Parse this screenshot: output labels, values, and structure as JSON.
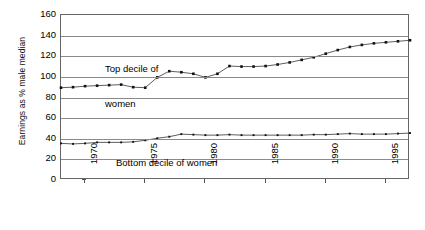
{
  "chart_data": {
    "type": "line",
    "title": "",
    "xlabel": "",
    "ylabel": "Earnings as % male median",
    "ylim": [
      0,
      160
    ],
    "ytick_step": 20,
    "yticks": [
      160,
      140,
      120,
      100,
      80,
      60,
      40,
      20,
      0
    ],
    "xlim": [
      1968,
      1997
    ],
    "xticks": [
      1970,
      1975,
      1980,
      1985,
      1990,
      1995
    ],
    "grid": true,
    "legend": "none",
    "marker": "filled-square",
    "line_color": "#333333",
    "grid_color": "#8a8a8a",
    "frame_color": "#666666",
    "annotations": [
      {
        "id": "top-decile",
        "text": "Top decile of\nwomen",
        "line1": "Top decile of",
        "line2": "women"
      },
      {
        "id": "bottom-decile",
        "text": "Bottom decile of women"
      }
    ],
    "x": [
      1968,
      1969,
      1970,
      1971,
      1972,
      1973,
      1974,
      1975,
      1976,
      1977,
      1978,
      1979,
      1980,
      1981,
      1982,
      1983,
      1984,
      1985,
      1986,
      1987,
      1988,
      1989,
      1990,
      1991,
      1992,
      1993,
      1994,
      1995,
      1996,
      1997
    ],
    "series": [
      {
        "name": "Top decile of women",
        "values": [
          89.5,
          90.0,
          91.0,
          91.5,
          92.0,
          92.5,
          90.0,
          89.5,
          99.5,
          105.5,
          104.5,
          103.0,
          99.5,
          103.0,
          110.5,
          110.0,
          110.0,
          110.5,
          112.0,
          114.0,
          116.5,
          119.0,
          122.5,
          126.0,
          129.0,
          131.0,
          132.5,
          133.5,
          134.5,
          135.5
        ]
      },
      {
        "name": "Bottom decile of women",
        "values": [
          35.5,
          35.0,
          35.5,
          36.5,
          36.5,
          36.5,
          37.0,
          38.5,
          40.5,
          42.0,
          44.5,
          44.0,
          43.5,
          43.5,
          44.0,
          43.5,
          43.5,
          43.5,
          43.5,
          43.5,
          43.5,
          44.0,
          44.0,
          44.5,
          45.0,
          44.5,
          44.5,
          44.5,
          45.0,
          45.5
        ]
      }
    ]
  },
  "axis": {
    "y_title": "Earnings as % male median",
    "y_tick_labels": [
      "160",
      "140",
      "120",
      "100",
      "80",
      "60",
      "40",
      "20",
      "0"
    ],
    "x_tick_labels": [
      "1970",
      "1975",
      "1980",
      "1985",
      "1990",
      "1995"
    ]
  },
  "annotations": {
    "top_line1": "Top decile of",
    "top_line2": "women",
    "bottom": "Bottom decile of women"
  }
}
